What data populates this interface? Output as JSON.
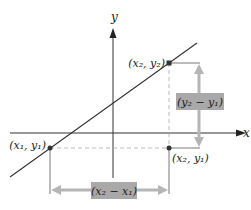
{
  "diagram": {
    "axes": {
      "x_label": "x",
      "y_label": "y"
    },
    "points": [
      {
        "id": "p1",
        "label": "(x₁, y₁)"
      },
      {
        "id": "p2",
        "label": "(x₂, y₂)"
      },
      {
        "id": "p3",
        "label": "(x₂, y₁)"
      }
    ],
    "dimensions": {
      "vertical": "(y₂ − y₁)",
      "horizontal": "(x₂ − x₁)"
    },
    "colors": {
      "line": "#333333",
      "arrow": "#b5b5b5",
      "label_box": "#a9a9a9",
      "point": "#333333",
      "dashed": "#aaaaaa"
    }
  }
}
